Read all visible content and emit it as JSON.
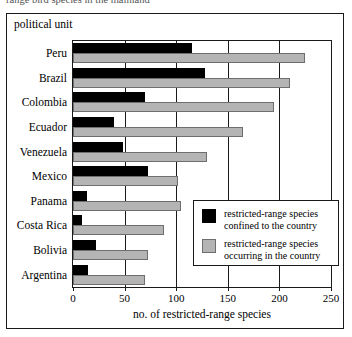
{
  "cut_caption": "range bird species in the mainland",
  "axis_title_y": "political unit",
  "axis_title_x": "no. of restricted-range species",
  "legend": {
    "items": [
      {
        "swatch": "black-swatch",
        "line1": "restricted-range species",
        "line2": "confined to the country"
      },
      {
        "swatch": "gray-swatch",
        "line1": "restricted-range species",
        "line2": "occurring in the country"
      }
    ]
  },
  "colors": {
    "confined": "#000000",
    "occurring": "#b4b4b4",
    "axis": "#1a1a1a",
    "background": "#ffffff"
  },
  "chart_data": {
    "type": "bar",
    "orientation": "horizontal",
    "title": "",
    "xlabel": "no. of restricted-range species",
    "ylabel": "political unit",
    "xlim": [
      0,
      250
    ],
    "xticks": [
      0,
      50,
      100,
      150,
      200,
      250
    ],
    "grid": true,
    "legend_position": "inside-right",
    "categories": [
      "Peru",
      "Brazil",
      "Colombia",
      "Ecuador",
      "Venezuela",
      "Mexico",
      "Panama",
      "Costa Rica",
      "Bolivia",
      "Argentina"
    ],
    "series": [
      {
        "name": "restricted-range species confined to the country",
        "color": "#000000",
        "values": [
          115,
          128,
          70,
          40,
          48,
          73,
          14,
          9,
          22,
          15
        ]
      },
      {
        "name": "restricted-range species occurring in the country",
        "color": "#b4b4b4",
        "values": [
          225,
          210,
          195,
          165,
          130,
          102,
          105,
          88,
          73,
          70
        ]
      }
    ]
  }
}
